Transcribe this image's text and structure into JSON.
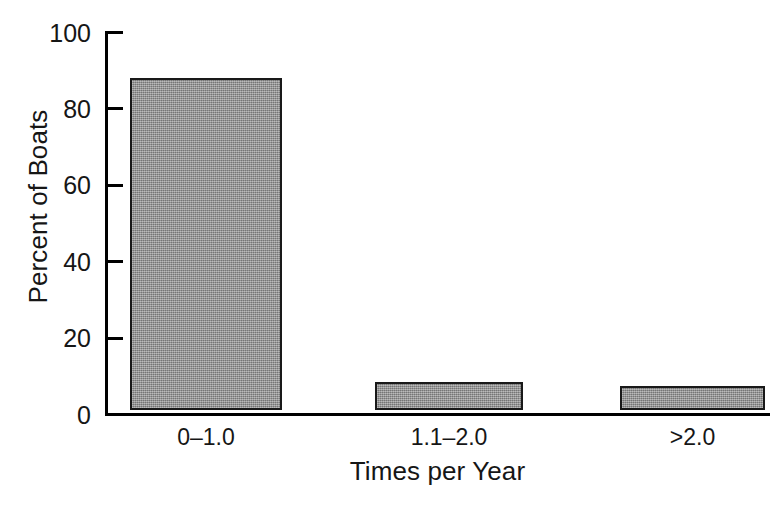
{
  "chart_data": {
    "type": "bar",
    "title": "",
    "subtitle": "",
    "xlabel": "Times per Year",
    "ylabel": "Percent of Boats",
    "categories": [
      "0–1.0",
      "1.1–2.0",
      ">2.0"
    ],
    "values": [
      87,
      7.3,
      6.3
    ],
    "series": [
      {
        "name": "Percent of Boats",
        "values": [
          87,
          7.3,
          6.3
        ]
      }
    ],
    "ylim": [
      0,
      100
    ],
    "yticks": [
      0,
      20,
      40,
      60,
      80,
      100
    ],
    "ytick_labels": [
      "0",
      "20",
      "40",
      "60",
      "80",
      "100"
    ],
    "grid": false,
    "legend": false,
    "legend_position": "none",
    "bar_fill_color": "#949494",
    "bar_edge_color": "#191919",
    "axis_color": "#000000",
    "background_color": "#ffffff",
    "annotations": []
  },
  "axes": {
    "y": {
      "title": "Percent of Boats",
      "ticks": [
        {
          "label": "100",
          "value": 100
        },
        {
          "label": "80",
          "value": 80
        },
        {
          "label": "60",
          "value": 60
        },
        {
          "label": "40",
          "value": 40
        },
        {
          "label": "20",
          "value": 20
        },
        {
          "label": "0",
          "value": 0
        }
      ]
    },
    "x": {
      "title": "Times per Year",
      "ticks": [
        {
          "label": "0–1.0"
        },
        {
          "label": "1.1–2.0"
        },
        {
          "label": ">2.0"
        }
      ]
    }
  }
}
